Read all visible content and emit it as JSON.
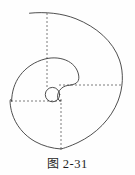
{
  "figure": {
    "caption_label": "图",
    "caption_number": "2-31",
    "caption_full": "图 2-31",
    "stroke_color": "#3b3b3b",
    "dash_color": "#5a5a5a",
    "background_color": "#fefefe",
    "stroke_width": 0.9,
    "dash_width": 0.8,
    "dash_pattern": "2,2"
  },
  "geometry": {
    "center_x": 61,
    "center_y": 85,
    "outer_arc": {
      "name": "outer-spiral-arc",
      "start_x": 29,
      "start_y": 13,
      "radius": 61,
      "top_y": 13,
      "bottom_y": 149,
      "left_x": 10,
      "right_x": 122
    },
    "middle_arc": {
      "name": "middle-spiral-arc",
      "radius": 34,
      "left_x": 12,
      "top_y": 58,
      "end_x": 70,
      "end_y": 85
    },
    "inner_arc": {
      "name": "inner-spiral-arc",
      "radius": 17,
      "end_x": 61,
      "end_y": 101
    },
    "small_circle": {
      "name": "innermost-circle",
      "cx": 52.5,
      "cy": 94.5,
      "r": 7.2
    },
    "dashed_lines": [
      {
        "name": "vertical-top-axis",
        "x1": 47,
        "y1": 13,
        "x2": 47,
        "y2": 88
      },
      {
        "name": "horizontal-right-axis",
        "x1": 61,
        "y1": 85,
        "x2": 122,
        "y2": 85
      },
      {
        "name": "horizontal-left-axis",
        "x1": 11,
        "y1": 101,
        "x2": 61,
        "y2": 101
      },
      {
        "name": "vertical-bottom-axis",
        "x1": 61,
        "y1": 101,
        "x2": 61,
        "y2": 149
      }
    ]
  }
}
